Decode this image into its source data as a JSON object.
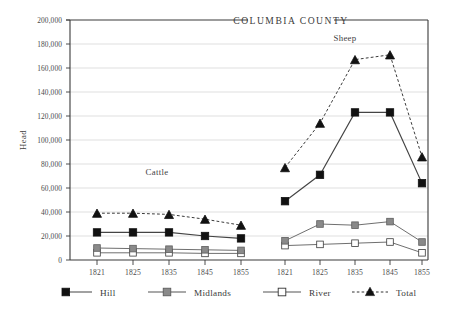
{
  "chart_data": {
    "type": "line",
    "title": "COLUMBIA COUNTY",
    "xlabel": "",
    "ylabel": "Head",
    "ylim": [
      0,
      200000
    ],
    "ytick_values": [
      0,
      20000,
      40000,
      60000,
      80000,
      100000,
      120000,
      140000,
      160000,
      180000,
      200000
    ],
    "ytick_labels": [
      "0",
      "20,000",
      "40,000",
      "60,000",
      "80,000",
      "100,000",
      "120,000",
      "140,000",
      "160,000",
      "180,000",
      "200,000"
    ],
    "grid": true,
    "grid_axis": "y",
    "legend_position": "below",
    "panel_groups": [
      {
        "name": "Cattle",
        "label": "Cattle",
        "categories": [
          "1821",
          "1825",
          "1835",
          "1845",
          "1855"
        ]
      },
      {
        "name": "Sheep",
        "label": "Sheep",
        "categories": [
          "1821",
          "1825",
          "1835",
          "1845",
          "1855"
        ]
      }
    ],
    "series": [
      {
        "name": "Hill",
        "marker": "filled-square",
        "color": "#1a1a1a",
        "linestyle": "solid",
        "values_cattle": [
          23000,
          23000,
          23000,
          20000,
          18000
        ],
        "values_sheep": [
          49000,
          71000,
          123000,
          123000,
          64000
        ]
      },
      {
        "name": "Midlands",
        "marker": "gray-square",
        "color": "#808080",
        "linestyle": "solid",
        "values_cattle": [
          10000,
          9500,
          9000,
          8500,
          8000
        ],
        "values_sheep": [
          16000,
          30000,
          29000,
          32000,
          15000
        ]
      },
      {
        "name": "River",
        "marker": "open-square",
        "color": "#ffffff",
        "linestyle": "solid",
        "values_cattle": [
          6000,
          6000,
          6000,
          5500,
          5500
        ],
        "values_sheep": [
          12000,
          13000,
          14000,
          15000,
          6000
        ]
      },
      {
        "name": "Total",
        "marker": "filled-triangle",
        "color": "#1a1a1a",
        "linestyle": "dashed",
        "values_cattle": [
          39000,
          39000,
          38000,
          34000,
          29000
        ],
        "values_sheep": [
          77000,
          114000,
          167000,
          171000,
          86000
        ]
      }
    ]
  },
  "legend": {
    "items": [
      {
        "label": "Hill",
        "marker": "filled-square",
        "linestyle": "solid"
      },
      {
        "label": "Midlands",
        "marker": "gray-square",
        "linestyle": "solid"
      },
      {
        "label": "River",
        "marker": "open-square",
        "linestyle": "solid"
      },
      {
        "label": "Total",
        "marker": "filled-triangle",
        "linestyle": "dashed"
      }
    ]
  },
  "colors": {
    "hill": "#1a1a1a",
    "midlands": "#808080",
    "river": "#ffffff",
    "total": "#1a1a1a",
    "grid": "#c8c8c8",
    "axis": "#3a3a3a",
    "text": "#3a3a3a",
    "background": "#ffffff"
  }
}
